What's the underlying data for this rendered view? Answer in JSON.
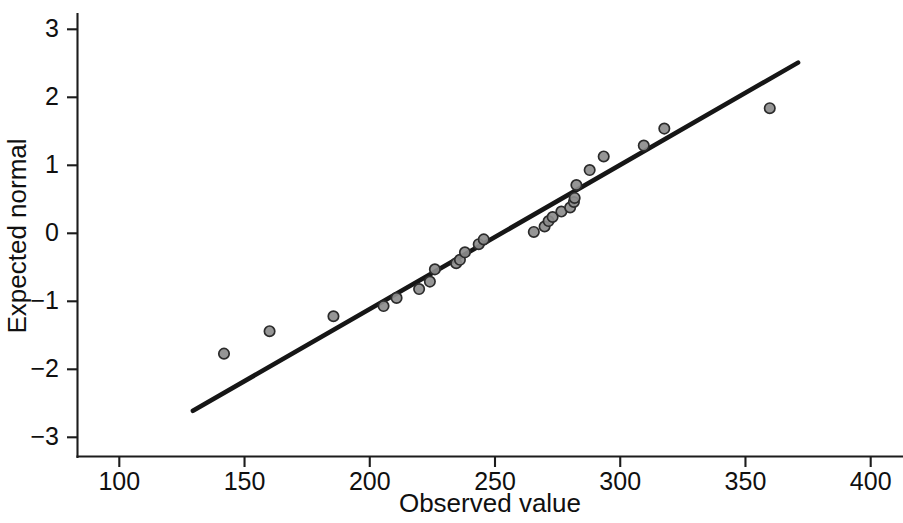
{
  "chart_data": {
    "type": "scatter",
    "title": "",
    "subtitle": "",
    "xlabel": "Observed value",
    "ylabel": "Expected normal",
    "xlim": [
      77,
      400
    ],
    "ylim": [
      -3.4,
      3.4
    ],
    "xticks": [
      100,
      150,
      200,
      250,
      300,
      350,
      400
    ],
    "xtick_labels": [
      "100",
      "150",
      "200",
      "250",
      "300",
      "350",
      "400"
    ],
    "yticks": [
      3,
      2,
      1,
      0,
      -1,
      -2,
      -3
    ],
    "ytick_labels": [
      "3",
      "2",
      "1",
      "0",
      "−1",
      "−2",
      "−3"
    ],
    "grid": false,
    "legend": false,
    "legend_position": "none",
    "marker": "open-circle",
    "marker_fill": "#8d8d8d",
    "marker_stroke": "#2b2b2b",
    "line_color": "#161616",
    "axis_color": "#1c1c1c",
    "background": "#ffffff",
    "series": [
      {
        "name": "Observed vs expected normal",
        "type": "scatter",
        "points": [
          [
            141.8,
            -1.77
          ],
          [
            160.0,
            -1.44
          ],
          [
            185.5,
            -1.22
          ],
          [
            205.5,
            -1.07
          ],
          [
            210.7,
            -0.95
          ],
          [
            219.7,
            -0.82
          ],
          [
            224.0,
            -0.71
          ],
          [
            226.0,
            -0.53
          ],
          [
            234.5,
            -0.44
          ],
          [
            236.0,
            -0.39
          ],
          [
            238.0,
            -0.28
          ],
          [
            243.5,
            -0.16
          ],
          [
            245.5,
            -0.09
          ],
          [
            265.5,
            0.02
          ],
          [
            269.8,
            0.1
          ],
          [
            271.4,
            0.18
          ],
          [
            273.0,
            0.24
          ],
          [
            276.5,
            0.32
          ],
          [
            280.0,
            0.38
          ],
          [
            281.5,
            0.46
          ],
          [
            281.8,
            0.52
          ],
          [
            282.5,
            0.71
          ],
          [
            287.8,
            0.93
          ],
          [
            293.4,
            1.13
          ],
          [
            309.4,
            1.29
          ],
          [
            317.6,
            1.54
          ],
          [
            359.7,
            1.84
          ]
        ]
      }
    ],
    "fit_line": {
      "name": "reference line",
      "x_start": 129.4,
      "y_start": -2.61,
      "x_end": 371.0,
      "y_end": 2.51
    }
  }
}
